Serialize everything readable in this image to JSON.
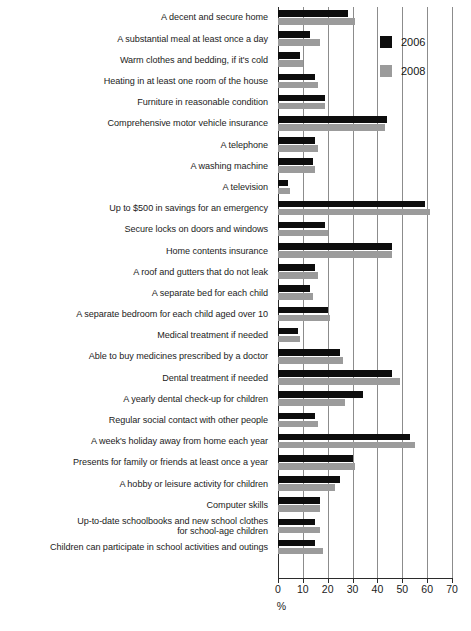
{
  "chart_data": {
    "type": "bar",
    "orientation": "horizontal",
    "title": "",
    "xlabel": "%",
    "ylabel": "",
    "xlim": [
      0,
      70
    ],
    "xticks": [
      0,
      10,
      20,
      30,
      40,
      50,
      60,
      70
    ],
    "grid": true,
    "legend_position": "top-right",
    "categories": [
      "A decent and secure home",
      "A substantial meal at least once a day",
      "Warm clothes and bedding, if it's cold",
      "Heating in at least one room of the house",
      "Furniture in reasonable condition",
      "Comprehensive motor vehicle insurance",
      "A telephone",
      "A washing machine",
      "A television",
      "Up to $500 in savings for an emergency",
      "Secure locks on doors and windows",
      "Home contents insurance",
      "A roof and gutters that do not leak",
      "A separate bed for each child",
      "A separate bedroom for each child aged over 10",
      "Medical treatment if needed",
      "Able to buy medicines prescribed by a doctor",
      "Dental treatment if needed",
      "A yearly dental check-up for children",
      "Regular social contact with other people",
      "A week's holiday away from home each year",
      "Presents for family or friends at least once a year",
      "A hobby or leisure activity for children",
      "Computer skills",
      "Up-to-date schoolbooks and new school clothes\nfor school-age children",
      "Children can participate in school activities and outings"
    ],
    "series": [
      {
        "name": "2006",
        "color": "#0d0d0d",
        "values": [
          28,
          13,
          9,
          15,
          19,
          44,
          15,
          14,
          4,
          59,
          19,
          46,
          15,
          13,
          20,
          8,
          25,
          46,
          34,
          15,
          53,
          30,
          25,
          17,
          15,
          15
        ]
      },
      {
        "name": "2008",
        "color": "#9b9b9b",
        "values": [
          31,
          17,
          10,
          16,
          19,
          43,
          16,
          15,
          5,
          61,
          20,
          46,
          16,
          14,
          21,
          9,
          26,
          49,
          27,
          16,
          55,
          31,
          23,
          17,
          17,
          18
        ]
      }
    ]
  },
  "legend": {
    "items": [
      {
        "label": "2006",
        "swatch": "black-square-icon"
      },
      {
        "label": "2008",
        "swatch": "gray-square-icon"
      }
    ]
  },
  "axis": {
    "x_title": "%",
    "tick_labels": [
      "0",
      "10",
      "20",
      "30",
      "40",
      "50",
      "60",
      "70"
    ]
  }
}
